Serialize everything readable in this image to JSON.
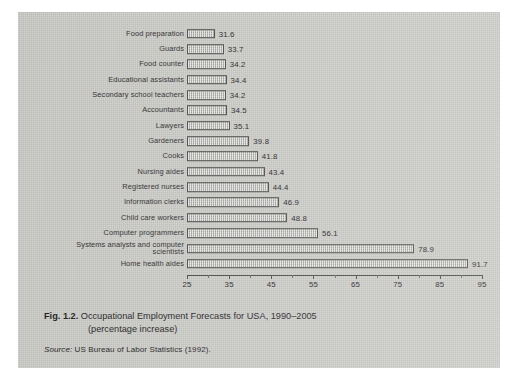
{
  "figure": {
    "number": "Fig. 1.2.",
    "caption_line1": "Occupational Employment Forecasts for USA, 1990–2005",
    "caption_line2": "(percentage increase)",
    "source_word": "Source:",
    "source_text": "US Bureau of Labor Statistics (1992)."
  },
  "chart_data": {
    "type": "bar",
    "orientation": "horizontal",
    "title": "Occupational Employment Forecasts for USA, 1990–2005 (percentage increase)",
    "xlabel": "",
    "ylabel": "",
    "xlim": [
      25,
      95
    ],
    "xticks": [
      25,
      35,
      45,
      55,
      65,
      75,
      85,
      95
    ],
    "xtick_labels": [
      "25",
      "35",
      "45",
      "55",
      "65",
      "75",
      "85",
      "95"
    ],
    "minor_tick_step": 5,
    "grid": false,
    "legend": false,
    "value_labels": true,
    "bar_fill": "#b4b4b0",
    "bar_border": "#4a4a48",
    "categories": [
      "Food preparation",
      "Guards",
      "Food counter",
      "Educational assistants",
      "Secondary school teachers",
      "Accountants",
      "Lawyers",
      "Gardeners",
      "Cooks",
      "Nursing aides",
      "Registered nurses",
      "Information clerks",
      "Child care workers",
      "Computer programmers",
      "Systems analysts and computer scientists",
      "Home health aides"
    ],
    "values": [
      31.6,
      33.7,
      34.2,
      34.4,
      34.2,
      34.5,
      35.1,
      39.8,
      41.8,
      43.4,
      44.4,
      46.9,
      48.8,
      56.1,
      78.9,
      91.7
    ],
    "value_text": [
      "31.6",
      "33.7",
      "34.2",
      "34.4",
      "34.2",
      "34.5",
      "35.1",
      "39.8",
      "41.8",
      "43.4",
      "44.4",
      "46.9",
      "48.8",
      "56.1",
      "78.9",
      "91.7"
    ]
  },
  "colors": {
    "page": "#c9c9c5",
    "ink": "#232323",
    "bar_fill": "#b4b4b0",
    "bar_border": "#4a4a48"
  }
}
